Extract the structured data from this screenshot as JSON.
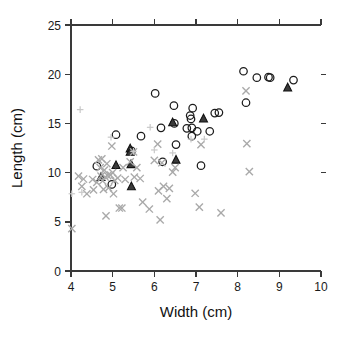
{
  "figure": {
    "background_color": "#ffffff",
    "axis_color": "#3a3a3a",
    "width": 346,
    "height": 340
  },
  "chart_data": {
    "type": "scatter",
    "title": "",
    "subtitle": "",
    "xlabel": "Width (cm)",
    "ylabel": "Length (cm)",
    "xlim": [
      4,
      10
    ],
    "ylim": [
      0,
      25
    ],
    "xticks": [
      4,
      5,
      6,
      7,
      8,
      9,
      10
    ],
    "yticks": [
      0,
      5,
      10,
      15,
      20,
      25
    ],
    "xtick_labels": [
      "4",
      "5",
      "6",
      "7",
      "8",
      "9",
      "10"
    ],
    "ytick_labels": [
      "0",
      "5",
      "10",
      "15",
      "20",
      "25"
    ],
    "grid": false,
    "legend": null,
    "legend_position": "none",
    "annotations": [],
    "series": [
      {
        "name": "open-circle-group",
        "marker": "circle-open",
        "color": "#1c1c1c",
        "size": 5.2,
        "points": [
          [
            4.62,
            10.65
          ],
          [
            4.98,
            8.8
          ],
          [
            5.08,
            13.85
          ],
          [
            5.45,
            12.2
          ],
          [
            5.68,
            13.7
          ],
          [
            6.02,
            18.05
          ],
          [
            6.16,
            14.55
          ],
          [
            6.2,
            11.1
          ],
          [
            6.47,
            16.8
          ],
          [
            6.48,
            15.0
          ],
          [
            6.52,
            12.85
          ],
          [
            6.78,
            14.5
          ],
          [
            6.86,
            15.8
          ],
          [
            6.88,
            15.45
          ],
          [
            6.9,
            14.55
          ],
          [
            6.9,
            13.7
          ],
          [
            6.92,
            16.55
          ],
          [
            7.03,
            14.2
          ],
          [
            7.12,
            10.7
          ],
          [
            7.33,
            14.2
          ],
          [
            7.45,
            16.05
          ],
          [
            7.55,
            16.1
          ],
          [
            8.14,
            20.3
          ],
          [
            8.2,
            17.1
          ],
          [
            8.46,
            19.65
          ],
          [
            8.74,
            19.7
          ],
          [
            8.78,
            19.65
          ],
          [
            9.34,
            19.4
          ]
        ]
      },
      {
        "name": "filled-triangle-group",
        "marker": "triangle-filled",
        "color": "#333333",
        "size": 5.0,
        "points": [
          [
            4.72,
            9.55
          ],
          [
            5.08,
            10.75
          ],
          [
            5.42,
            12.45
          ],
          [
            5.42,
            12.1
          ],
          [
            5.44,
            10.85
          ],
          [
            5.45,
            8.6
          ],
          [
            6.44,
            15.1
          ],
          [
            6.52,
            11.3
          ],
          [
            7.18,
            15.5
          ],
          [
            9.2,
            18.65
          ]
        ]
      },
      {
        "name": "gray-cross-group",
        "marker": "cross",
        "color": "#a9a9a9",
        "size": 4.4,
        "points": [
          [
            4.02,
            4.3
          ],
          [
            4.18,
            9.65
          ],
          [
            4.26,
            8.6
          ],
          [
            4.3,
            9.35
          ],
          [
            4.38,
            7.85
          ],
          [
            4.52,
            9.3
          ],
          [
            4.54,
            8.25
          ],
          [
            4.62,
            9.0
          ],
          [
            4.66,
            11.3
          ],
          [
            4.7,
            10.5
          ],
          [
            4.72,
            9.65
          ],
          [
            4.74,
            11.4
          ],
          [
            4.76,
            9.15
          ],
          [
            4.78,
            8.3
          ],
          [
            4.8,
            10.25
          ],
          [
            4.82,
            9.55
          ],
          [
            4.84,
            5.6
          ],
          [
            4.86,
            10.9
          ],
          [
            4.88,
            9.7
          ],
          [
            4.9,
            8.45
          ],
          [
            4.95,
            9.75
          ],
          [
            4.98,
            12.7
          ],
          [
            5.0,
            10.0
          ],
          [
            5.02,
            7.85
          ],
          [
            5.05,
            9.2
          ],
          [
            5.12,
            9.45
          ],
          [
            5.16,
            6.4
          ],
          [
            5.22,
            6.4
          ],
          [
            5.25,
            10.5
          ],
          [
            5.3,
            9.3
          ],
          [
            5.42,
            11.1
          ],
          [
            5.5,
            12.1
          ],
          [
            5.52,
            9.55
          ],
          [
            5.58,
            10.5
          ],
          [
            5.66,
            9.4
          ],
          [
            5.72,
            7.0
          ],
          [
            5.88,
            6.3
          ],
          [
            6.0,
            11.25
          ],
          [
            6.08,
            12.9
          ],
          [
            6.1,
            8.15
          ],
          [
            6.14,
            5.2
          ],
          [
            6.18,
            11.0
          ],
          [
            6.22,
            8.6
          ],
          [
            6.3,
            7.35
          ],
          [
            6.36,
            8.4
          ],
          [
            6.44,
            10.05
          ],
          [
            6.5,
            10.5
          ],
          [
            6.98,
            7.9
          ],
          [
            7.08,
            6.5
          ],
          [
            7.12,
            12.85
          ],
          [
            7.6,
            5.9
          ],
          [
            8.2,
            18.3
          ],
          [
            8.22,
            12.95
          ],
          [
            8.28,
            10.1
          ]
        ]
      },
      {
        "name": "light-plus-group",
        "marker": "plus",
        "color": "#c9c9c9",
        "size": 4.0,
        "points": [
          [
            4.02,
            7.85
          ],
          [
            4.22,
            16.4
          ],
          [
            4.26,
            8.0
          ],
          [
            4.96,
            13.6
          ],
          [
            5.5,
            12.15
          ],
          [
            5.9,
            14.6
          ],
          [
            6.0,
            12.3
          ],
          [
            6.44,
            12.0
          ],
          [
            7.2,
            13.4
          ],
          [
            6.88,
            13.4
          ]
        ]
      }
    ]
  }
}
